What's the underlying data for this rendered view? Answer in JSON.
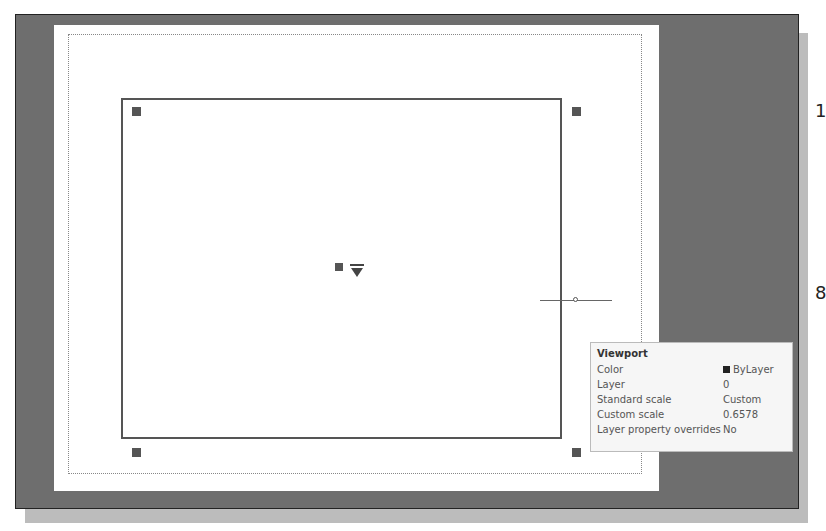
{
  "tooltip": {
    "title": "Viewport",
    "rows": [
      {
        "label": "Color",
        "value": "ByLayer",
        "swatch": "#222222"
      },
      {
        "label": "Layer",
        "value": "0"
      },
      {
        "label": "Standard scale",
        "value": "Custom"
      },
      {
        "label": "Custom scale",
        "value": "0.6578"
      },
      {
        "label": "Layer property overrides",
        "value": "No"
      }
    ]
  },
  "edge_text": {
    "top": "1",
    "bottom": "8"
  },
  "colors": {
    "canvas": "#6e6e6e",
    "sheet": "#ffffff",
    "viewport_border": "#555555",
    "tooltip_bg": "#f6f6f6"
  }
}
